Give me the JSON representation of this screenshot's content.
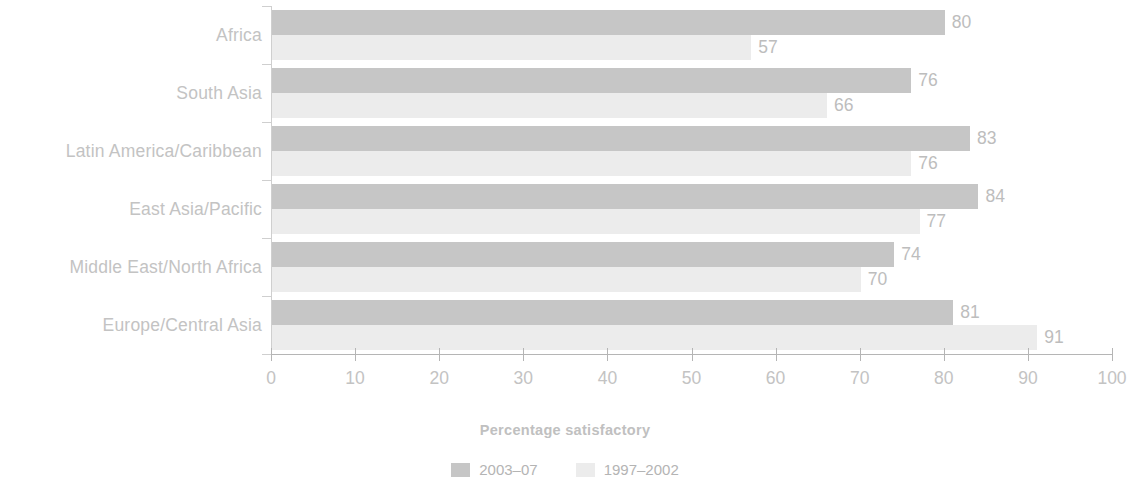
{
  "chart_data": {
    "type": "bar",
    "orientation": "horizontal",
    "title": "",
    "subtitle": "",
    "xlabel": "Percentage satisfactory",
    "ylabel": "",
    "xlim": [
      0,
      100
    ],
    "ylim": null,
    "grid": false,
    "legend_position": "bottom-center",
    "categories": [
      "Africa",
      "South Asia",
      "Latin America/Caribbean",
      "East Asia/Pacific",
      "Middle East/North Africa",
      "Europe/Central Asia"
    ],
    "x_ticks": [
      0,
      10,
      20,
      30,
      40,
      50,
      60,
      70,
      80,
      90,
      100
    ],
    "x_tick_labels": [
      "0",
      "10",
      "20",
      "30",
      "40",
      "50",
      "60",
      "70",
      "80",
      "90",
      "100"
    ],
    "series": [
      {
        "name": "2003–07",
        "color": "#c6c6c6",
        "values": [
          80,
          76,
          83,
          84,
          74,
          81
        ],
        "value_labels": [
          "80",
          "76",
          "83",
          "84",
          "74",
          "81"
        ]
      },
      {
        "name": "1997–2002",
        "color": "#ececec",
        "values": [
          57,
          66,
          76,
          77,
          70,
          91
        ],
        "value_labels": [
          "57",
          "66",
          "76",
          "77",
          "70",
          "91"
        ]
      }
    ],
    "annotations": []
  },
  "axis": {
    "x_title": "Percentage satisfactory"
  },
  "legend": {
    "items": [
      {
        "label": "2003–07",
        "color": "#c6c6c6"
      },
      {
        "label": "1997–2002",
        "color": "#ececec"
      }
    ]
  },
  "colors": {
    "series_a": "#c6c6c6",
    "series_b": "#ececec",
    "axis": "#b5b5b5",
    "text": "#c0c0c0",
    "background": "#ffffff"
  }
}
